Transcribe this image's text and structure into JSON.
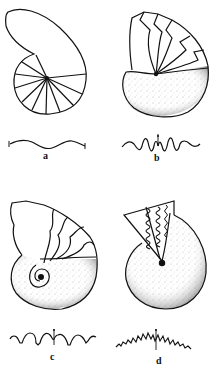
{
  "figure": {
    "panels": [
      {
        "id": "a",
        "label": "a",
        "shell": "coiled shell with smooth septa",
        "suture": "gently undulating suture"
      },
      {
        "id": "b",
        "label": "b",
        "shell": "stippled coiled shell with zigzag septa",
        "suture": "zigzag suture with lobes and saddles"
      },
      {
        "id": "c",
        "label": "c",
        "shell": "stippled coiled shell with lobed septa",
        "suture": "rounded saddles with denticulated lobes"
      },
      {
        "id": "d",
        "label": "d",
        "shell": "stippled coiled shell with highly folded septa",
        "suture": "complexly frilled suture"
      }
    ],
    "colors": {
      "ink": "#111111",
      "background": "#ffffff",
      "stipple": "#555555"
    }
  }
}
